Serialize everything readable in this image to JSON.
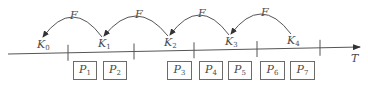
{
  "diagram": {
    "axis_label": "T",
    "arc_label": "F",
    "stroke_color": "#555555",
    "text_color": "#4a4a4a",
    "keys": [
      {
        "id": "K0",
        "base": "K",
        "sub": "0",
        "x": 37,
        "y": 39
      },
      {
        "id": "K1",
        "base": "K",
        "sub": "1",
        "x": 98,
        "y": 38
      },
      {
        "id": "K2",
        "base": "K",
        "sub": "2",
        "x": 164,
        "y": 37
      },
      {
        "id": "K3",
        "base": "K",
        "sub": "3",
        "x": 225,
        "y": 36
      },
      {
        "id": "K4",
        "base": "K",
        "sub": "4",
        "x": 287,
        "y": 35
      }
    ],
    "arcs": [
      {
        "from": "K1",
        "to": "K0",
        "label": "F",
        "label_x": 70,
        "label_y": 10
      },
      {
        "from": "K2",
        "to": "K1",
        "label": "F",
        "label_x": 135,
        "label_y": 9
      },
      {
        "from": "K3",
        "to": "K2",
        "label": "F",
        "label_x": 198,
        "label_y": 8
      },
      {
        "from": "K4",
        "to": "K3",
        "label": "F",
        "label_x": 261,
        "label_y": 7
      }
    ],
    "ticks": [
      68,
      134,
      194,
      257,
      320
    ],
    "packets": [
      {
        "id": "P1",
        "base": "P",
        "sub": "1",
        "x": 73,
        "w": 24
      },
      {
        "id": "P2",
        "base": "P",
        "sub": "2",
        "x": 103,
        "w": 24
      },
      {
        "id": "P3",
        "base": "P",
        "sub": "3",
        "x": 167,
        "w": 25
      },
      {
        "id": "P4",
        "base": "P",
        "sub": "4",
        "x": 199,
        "w": 24
      },
      {
        "id": "P5",
        "base": "P",
        "sub": "5",
        "x": 228,
        "w": 24
      },
      {
        "id": "P6",
        "base": "P",
        "sub": "6",
        "x": 260,
        "w": 25
      },
      {
        "id": "P7",
        "base": "P",
        "sub": "7",
        "x": 290,
        "w": 25
      }
    ]
  }
}
